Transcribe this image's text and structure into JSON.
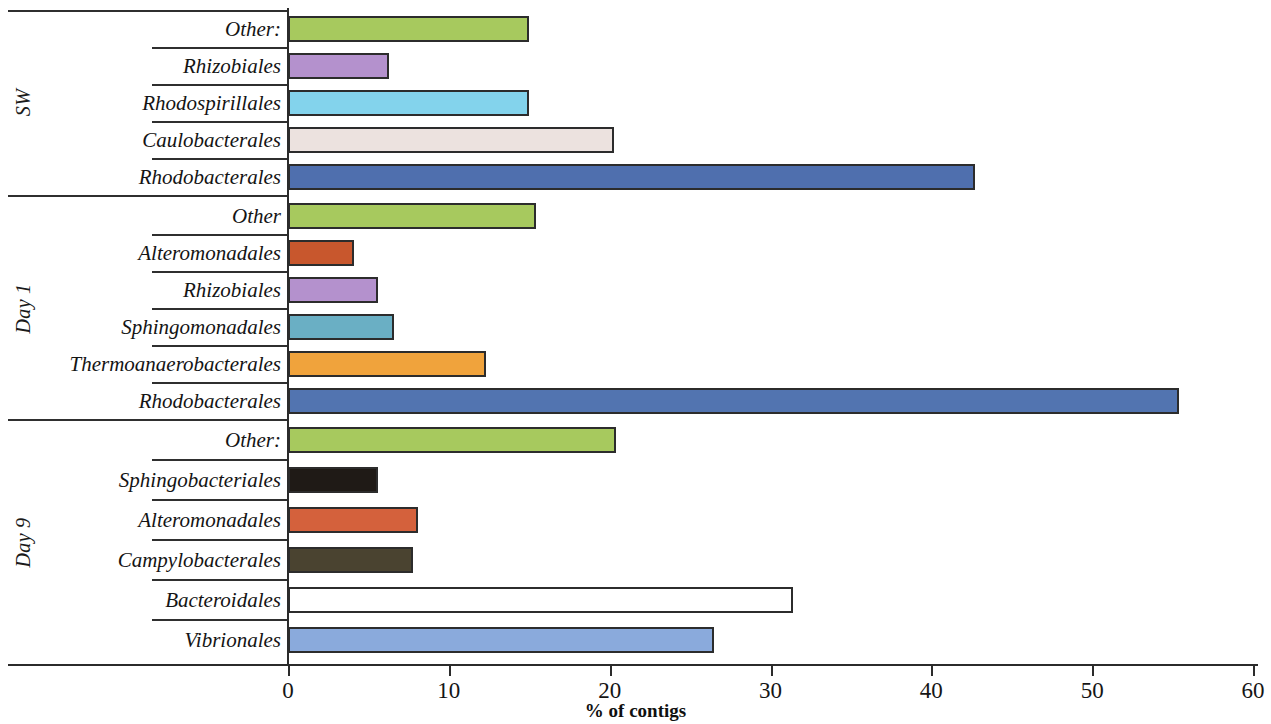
{
  "chart_data": {
    "type": "bar",
    "orientation": "horizontal",
    "title": "",
    "xlabel": "% of contigs",
    "ylabel": "",
    "xlim": [
      0,
      60
    ],
    "xticks": [
      0,
      10,
      20,
      30,
      40,
      50,
      60
    ],
    "xtick_labels": [
      "0",
      "10",
      "20",
      "30",
      "40",
      "50",
      "60"
    ],
    "grid": false,
    "legend": "none",
    "groups": [
      {
        "name": "SW",
        "categories": [
          "Other:",
          "Rhizobiales",
          "Rhodospirillales",
          "Caulobacterales",
          "Rhodobacterales"
        ],
        "values": [
          15.0,
          6.3,
          15.0,
          20.3,
          42.7
        ],
        "colors": [
          "#a7c95e",
          "#b491cd",
          "#83d3ec",
          "#ece2df",
          "#4f6fae"
        ]
      },
      {
        "name": "Day 1",
        "categories": [
          "Other",
          "Alteromonadales",
          "Rhizobiales",
          "Sphingomonadales",
          "Thermoanaerobacterales",
          "Rhodobacterales"
        ],
        "values": [
          15.4,
          4.1,
          5.6,
          6.6,
          12.3,
          55.4
        ],
        "colors": [
          "#a7c95e",
          "#c8572d",
          "#b491cd",
          "#6aafc4",
          "#f0a33c",
          "#5274b0"
        ]
      },
      {
        "name": "Day 9",
        "categories": [
          "Other:",
          "Sphingobacteriales",
          "Alteromonadales",
          "Campylobacterales",
          "Bacteroidales",
          "Vibrionales"
        ],
        "values": [
          20.4,
          5.6,
          8.1,
          7.8,
          31.4,
          26.5
        ],
        "colors": [
          "#a7c95e",
          "#1f1a16",
          "#d4613c",
          "#4a4330",
          "#ffffff",
          "#8aaadc"
        ]
      }
    ]
  }
}
